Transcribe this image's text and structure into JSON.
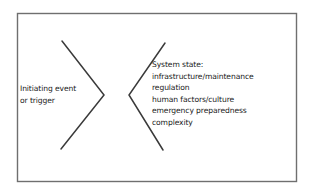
{
  "diagram": {
    "type": "bowtie-chevron-diagram",
    "background_color": "#ffffff",
    "stroke_color": "#3a3a3a",
    "text_color": "#1a1a1a",
    "border": {
      "name": "outer-frame",
      "x": 17,
      "y": 13,
      "width": 279,
      "height": 168
    },
    "left_chevron": {
      "name": "left-chevron",
      "direction": "points-right",
      "points": "62,41 104,95 61,149"
    },
    "right_chevron": {
      "name": "right-chevron",
      "direction": "opens-right",
      "points": "165,43 129,95 163,150"
    },
    "left_text": {
      "lines": [
        "Initiating event",
        "or trigger"
      ]
    },
    "right_text": {
      "lines": [
        "System state:",
        "infrastructure/maintenance",
        "regulation",
        "human factors/culture",
        "emergency preparedness",
        "complexity"
      ]
    }
  }
}
